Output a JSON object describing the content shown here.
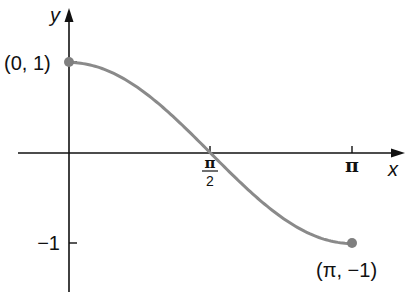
{
  "chart_data": {
    "type": "line",
    "title": "",
    "function": "y = cos(x), 0 <= x <= pi",
    "xlabel": "x",
    "ylabel": "y",
    "x_ticks": [
      {
        "value": 1.5708,
        "label_num": "π",
        "label_den": "2"
      },
      {
        "value": 3.1416,
        "label": "π"
      }
    ],
    "y_ticks": [
      {
        "value": -1,
        "label": "−1"
      }
    ],
    "points": [
      {
        "x": 0,
        "y": 1,
        "label": "(0, 1)"
      },
      {
        "x": 3.1416,
        "y": -1,
        "label": "(π, −1)"
      }
    ],
    "series": [
      {
        "name": "cos x",
        "color": "#8a8a8a",
        "x": [
          0,
          0.3927,
          0.7854,
          1.1781,
          1.5708,
          1.9635,
          2.3562,
          2.7489,
          3.1416
        ],
        "values": [
          1,
          0.924,
          0.707,
          0.383,
          0,
          -0.383,
          -0.707,
          -0.924,
          -1
        ]
      }
    ],
    "xlim": [
      0,
      3.5
    ],
    "ylim": [
      -1.4,
      1.6
    ],
    "grid": false,
    "legend": "none"
  },
  "labels": {
    "y_axis": "y",
    "x_axis": "x",
    "pi_half_num": "π",
    "pi_half_den": "2",
    "pi": "π",
    "neg_one": "−1",
    "start_point": "(0, 1)",
    "end_point": "(π, −1)"
  },
  "colors": {
    "axis": "#111111",
    "curve": "#8a8a8a",
    "point": "#7f7f7f"
  }
}
